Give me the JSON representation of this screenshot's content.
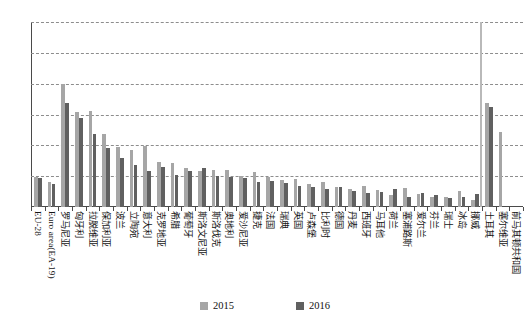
{
  "chart_data": {
    "type": "bar",
    "title": "",
    "subtitle": "",
    "xlabel": "",
    "ylabel": "",
    "ylim": [
      0,
      30
    ],
    "yticks": [
      0,
      5,
      10,
      15,
      20,
      25,
      30
    ],
    "grid": true,
    "legend_position": "bottom-center",
    "categories": [
      "EU-28",
      "Euro area(EA-19)",
      "罗马尼亚",
      "匈牙利",
      "拉脱维亚",
      "保加利亚",
      "波兰",
      "立陶宛",
      "意大利",
      "克罗地亚",
      "希腊",
      "葡萄牙",
      "斯洛文尼亚",
      "斯洛伐克",
      "奥地利",
      "爱沙尼亚",
      "捷克",
      "法国",
      "瑞典",
      "英国",
      "卢森堡",
      "比利时",
      "德国",
      "丹麦",
      "西班牙",
      "马耳他",
      "荷兰",
      "塞浦路斯",
      "爱尔兰",
      "芬兰",
      "瑞士",
      "冰岛",
      "挪威",
      "土耳其",
      "塞尔维亚",
      "前马其顿共和国"
    ],
    "series": [
      {
        "name": "2015",
        "color": "#a6a6a6",
        "values": [
          4.9,
          4.0,
          19.9,
          15.4,
          15.5,
          11.8,
          9.8,
          9.2,
          9.9,
          7.3,
          7.2,
          6.3,
          5.8,
          6.0,
          6.0,
          5.1,
          5.7,
          4.9,
          4.4,
          4.6,
          3.8,
          4.0,
          3.2,
          3.0,
          3.4,
          2.7,
          2.0,
          3.1,
          2.1,
          1.6,
          1.7,
          2.6,
          1.2,
          16.9,
          12.2,
          0.0
        ]
      },
      {
        "name": "2016",
        "color": "#606060",
        "values": [
          4.7,
          3.8,
          16.8,
          14.5,
          11.9,
          9.6,
          8.0,
          6.8,
          5.9,
          6.5,
          5.2,
          5.9,
          6.3,
          5.0,
          4.9,
          4.7,
          4.1,
          4.2,
          3.9,
          3.4,
          3.2,
          2.9,
          3.3,
          2.6,
          2.2,
          2.4,
          2.9,
          1.7,
          2.2,
          2.0,
          1.5,
          1.7,
          2.1,
          16.2,
          0.0,
          0.0
        ]
      }
    ],
    "separator_after_category_index": 32,
    "annotations": []
  },
  "legend": {
    "items": [
      {
        "label": "2015",
        "color": "#a6a6a6"
      },
      {
        "label": "2016",
        "color": "#606060"
      }
    ]
  }
}
